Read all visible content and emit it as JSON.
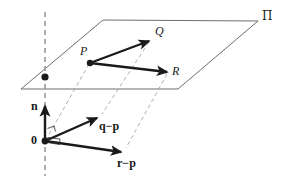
{
  "figure": {
    "background_color": "#ffffff",
    "stroke_color": "#1a1a1a",
    "plane_edge_color": "#6e6e6e",
    "dashed_color": "#9a9a9a",
    "width": 282,
    "height": 182
  },
  "labels": {
    "plane": "Π",
    "point_p": "P",
    "point_q": "Q",
    "point_r": "R",
    "normal": "n",
    "origin": "0",
    "vector_qp": "q−p",
    "vector_rp": "r−p"
  },
  "geometry": {
    "plane_corners": [
      {
        "name": "left",
        "x": 21,
        "y": 89
      },
      {
        "name": "top-left",
        "x": 103,
        "y": 20
      },
      {
        "name": "top-right",
        "x": 258,
        "y": 21
      },
      {
        "name": "bottom-right",
        "x": 178,
        "y": 89
      }
    ],
    "points": [
      {
        "name": "P",
        "x": 90,
        "y": 63
      },
      {
        "name": "Q",
        "x": 150,
        "y": 40
      },
      {
        "name": "R",
        "x": 168,
        "y": 72
      },
      {
        "name": "origin",
        "x": 45,
        "y": 141
      },
      {
        "name": "plane-dot",
        "x": 45,
        "y": 77
      }
    ],
    "vectors": [
      {
        "name": "PQ",
        "from": [
          90,
          63
        ],
        "to": [
          150,
          40
        ]
      },
      {
        "name": "PR",
        "from": [
          90,
          63
        ],
        "to": [
          168,
          72
        ]
      },
      {
        "name": "n",
        "from": [
          45,
          141
        ],
        "to": [
          45,
          105
        ]
      },
      {
        "name": "q-p",
        "from": [
          45,
          141
        ],
        "to": [
          98,
          117
        ]
      },
      {
        "name": "r-p",
        "from": [
          45,
          141
        ],
        "to": [
          122,
          152
        ]
      }
    ],
    "dashed_lines": [
      {
        "name": "axis",
        "from": [
          45,
          12
        ],
        "to": [
          45,
          176
        ]
      },
      {
        "name": "P-to-origin",
        "from": [
          90,
          63
        ],
        "to": [
          47,
          139
        ]
      },
      {
        "name": "Q-to-qp",
        "from": [
          150,
          40
        ],
        "to": [
          101,
          115
        ]
      },
      {
        "name": "R-to-rp",
        "from": [
          168,
          72
        ],
        "to": [
          125,
          150
        ]
      }
    ],
    "right_angle_marks": [
      {
        "name": "n-qp",
        "x": 49,
        "y": 131
      },
      {
        "name": "n-rp",
        "x": 49,
        "y": 141
      }
    ]
  }
}
